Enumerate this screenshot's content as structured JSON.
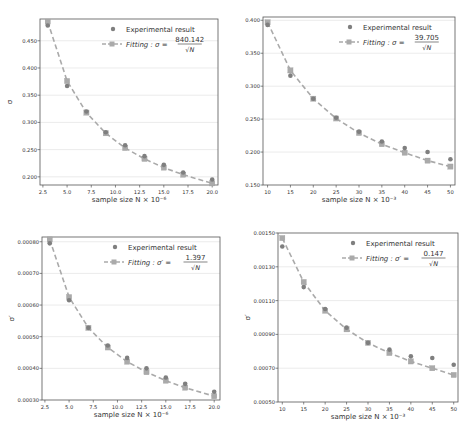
{
  "colors": {
    "experimental": "#7f7f7f",
    "fit": "#aaaaaa",
    "grid": "#e6e6e6",
    "axis": "#555555",
    "text": "#333333"
  },
  "chart_data": [
    {
      "id": "top-left",
      "type": "line",
      "title": "",
      "xlabel": "sample size N × 10⁻⁶",
      "ylabel": "σ",
      "legend": {
        "position": "upper right",
        "entries": [
          "Experimental result",
          "Fitting : σ = 840.142 / √N"
        ]
      },
      "fit_label": {
        "prefix": "Fitting : σ =",
        "numerator": "840.142",
        "denominator": "√N"
      },
      "grid": "horizontal",
      "xlim": [
        2.2,
        20.6
      ],
      "ylim": [
        0.185,
        0.49
      ],
      "xticks": [
        2.5,
        5.0,
        7.5,
        10.0,
        12.5,
        15.0,
        17.5,
        20.0
      ],
      "xtick_labels": [
        "2.5",
        "5.0",
        "7.5",
        "10.0",
        "12.5",
        "15.0",
        "17.5",
        "20.0"
      ],
      "yticks": [
        0.2,
        0.25,
        0.3,
        0.35,
        0.4,
        0.45
      ],
      "ytick_labels": [
        "0.200",
        "0.250",
        "0.300",
        "0.350",
        "0.400",
        "0.450"
      ],
      "x": [
        3,
        5,
        7,
        9,
        11,
        13,
        15,
        17,
        20
      ],
      "series": [
        {
          "name": "Experimental result",
          "values": [
            0.478,
            0.367,
            0.32,
            0.282,
            0.258,
            0.238,
            0.222,
            0.208,
            0.195
          ]
        },
        {
          "name": "Fitting",
          "values": [
            0.485,
            0.376,
            0.318,
            0.28,
            0.253,
            0.233,
            0.217,
            0.204,
            0.188
          ]
        }
      ]
    },
    {
      "id": "top-right",
      "type": "line",
      "title": "",
      "xlabel": "sample size N × 10⁻³",
      "ylabel": "σ",
      "legend": {
        "position": "upper right",
        "entries": [
          "Experimental result",
          "Fitting : σ = 39.705 / √N"
        ]
      },
      "fit_label": {
        "prefix": "Fitting : σ =",
        "numerator": "39.705",
        "denominator": "√N"
      },
      "grid": "horizontal",
      "xlim": [
        9,
        51
      ],
      "ylim": [
        0.15,
        0.405
      ],
      "xticks": [
        10,
        15,
        20,
        25,
        30,
        35,
        40,
        45,
        50
      ],
      "xtick_labels": [
        "10",
        "15",
        "20",
        "25",
        "30",
        "35",
        "40",
        "45",
        "50"
      ],
      "yticks": [
        0.15,
        0.2,
        0.25,
        0.3,
        0.35,
        0.4
      ],
      "ytick_labels": [
        "0.150",
        "0.200",
        "0.250",
        "0.300",
        "0.350",
        "0.400"
      ],
      "x": [
        10,
        15,
        20,
        25,
        30,
        35,
        40,
        45,
        50
      ],
      "series": [
        {
          "name": "Experimental result",
          "values": [
            0.393,
            0.316,
            0.281,
            0.252,
            0.231,
            0.216,
            0.206,
            0.2,
            0.189
          ]
        },
        {
          "name": "Fitting",
          "values": [
            0.397,
            0.324,
            0.281,
            0.251,
            0.229,
            0.212,
            0.199,
            0.187,
            0.178
          ]
        }
      ]
    },
    {
      "id": "bottom-left",
      "type": "line",
      "title": "",
      "xlabel": "sample size N × 10⁻⁶",
      "ylabel": "σ′",
      "legend": {
        "position": "upper right",
        "entries": [
          "Experimental result",
          "Fitting : σ′ = 1.397 / √N"
        ]
      },
      "fit_label": {
        "prefix": "Fitting : σ′ =",
        "numerator": "1.397",
        "denominator": "√N"
      },
      "grid": "horizontal",
      "xlim": [
        2.2,
        20.6
      ],
      "ylim": [
        0.0003,
        0.000815
      ],
      "xticks": [
        2.5,
        5.0,
        7.5,
        10.0,
        12.5,
        15.0,
        17.5,
        20.0
      ],
      "xtick_labels": [
        "2.5",
        "5.0",
        "7.5",
        "10.0",
        "12.5",
        "15.0",
        "17.5",
        "20.0"
      ],
      "yticks": [
        0.0003,
        0.0004,
        0.0005,
        0.0006,
        0.0007,
        0.0008
      ],
      "ytick_labels": [
        "0.00030",
        "0.00040",
        "0.00050",
        "0.00060",
        "0.00070",
        "0.00080"
      ],
      "x": [
        3,
        5,
        7,
        9,
        11,
        13,
        15,
        17,
        20
      ],
      "series": [
        {
          "name": "Experimental result",
          "values": [
            0.000795,
            0.000615,
            0.000528,
            0.000472,
            0.000433,
            0.0004,
            0.000371,
            0.000351,
            0.000326
          ]
        },
        {
          "name": "Fitting",
          "values": [
            0.000807,
            0.000625,
            0.000528,
            0.000466,
            0.000421,
            0.000388,
            0.000361,
            0.000339,
            0.000312
          ]
        }
      ]
    },
    {
      "id": "bottom-right",
      "type": "line",
      "title": "",
      "xlabel": "sample size N × 10⁻³",
      "ylabel": "σ′",
      "legend": {
        "position": "upper right",
        "entries": [
          "Experimental result",
          "Fitting : σ′ = 0.147 / √N"
        ]
      },
      "fit_label": {
        "prefix": "Fitting : σ′ =",
        "numerator": "0.147",
        "denominator": "√N"
      },
      "grid": "horizontal",
      "xlim": [
        9,
        51
      ],
      "ylim": [
        0.0005,
        0.0015
      ],
      "xticks": [
        10,
        15,
        20,
        25,
        30,
        35,
        40,
        45,
        50
      ],
      "xtick_labels": [
        "10",
        "15",
        "20",
        "25",
        "30",
        "35",
        "40",
        "45",
        "50"
      ],
      "yticks": [
        0.0005,
        0.0007,
        0.0009,
        0.0011,
        0.0013,
        0.0015
      ],
      "ytick_labels": [
        "0.00050",
        "0.00070",
        "0.00090",
        "0.00110",
        "0.00130",
        "0.00150"
      ],
      "x": [
        10,
        15,
        20,
        25,
        30,
        35,
        40,
        45,
        50
      ],
      "series": [
        {
          "name": "Experimental result",
          "values": [
            0.00142,
            0.00118,
            0.00105,
            0.00094,
            0.00085,
            0.00081,
            0.00077,
            0.00076,
            0.00072
          ]
        },
        {
          "name": "Fitting",
          "values": [
            0.00147,
            0.00121,
            0.00104,
            0.00093,
            0.00085,
            0.00079,
            0.00074,
            0.0007,
            0.00066
          ]
        }
      ]
    }
  ],
  "layout": [
    {
      "left": 0,
      "top": 0,
      "width": 236,
      "height": 216,
      "plot": {
        "x": 40,
        "y": 19,
        "w": 178,
        "h": 166
      }
    },
    {
      "left": 236,
      "top": 0,
      "width": 236,
      "height": 216,
      "plot": {
        "x": 27,
        "y": 17,
        "w": 192,
        "h": 168
      }
    },
    {
      "left": 0,
      "top": 216,
      "width": 236,
      "height": 217,
      "plot": {
        "x": 42,
        "y": 21,
        "w": 178,
        "h": 163
      }
    },
    {
      "left": 236,
      "top": 216,
      "width": 236,
      "height": 217,
      "plot": {
        "x": 42,
        "y": 17,
        "w": 180,
        "h": 169
      }
    }
  ]
}
